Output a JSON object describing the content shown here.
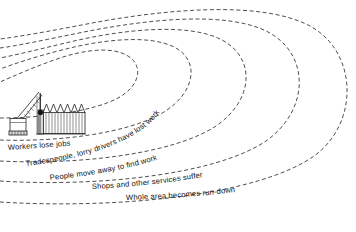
{
  "diagram": {
    "type": "ripple-effect-diagram",
    "title_visible": false,
    "background_color": "#ffffff",
    "line_color": "#3a3a3a",
    "line_style": "dashed",
    "illustration": {
      "name": "demolition-scene",
      "parts": [
        "crane-with-wrecking-ball",
        "factory-with-sawtooth-roof"
      ]
    },
    "ripples": [
      {
        "index": 1,
        "label": "Workers lose jobs"
      },
      {
        "index": 2,
        "label": "Tradespeople, lorry drivers have lost work"
      },
      {
        "index": 3,
        "label": "People move away to find work"
      },
      {
        "index": 4,
        "label": "Shops and other services suffer"
      },
      {
        "index": 5,
        "label": "Whole area becomes run-down"
      }
    ]
  }
}
